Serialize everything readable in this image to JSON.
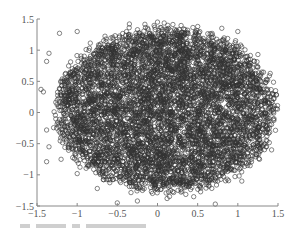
{
  "chart_data": {
    "type": "scatter",
    "title": "",
    "xlabel": "",
    "ylabel": "",
    "xlim": [
      -1.5,
      1.5
    ],
    "ylim": [
      -1.5,
      1.5
    ],
    "grid": false,
    "legend": null,
    "marker": "open-circle",
    "marker_color": "#333333",
    "x_ticks": [
      -1.5,
      -1,
      -0.5,
      0,
      0.5,
      1,
      1.5
    ],
    "x_tick_labels": [
      "-1.5",
      "-1",
      "-0.5",
      "0",
      "0.5",
      "1",
      "1.5"
    ],
    "y_ticks": [
      -1.5,
      -1,
      -0.5,
      0,
      0.5,
      1,
      1.5
    ],
    "y_tick_labels": [
      "-1.5",
      "-1",
      "-0.5",
      "0",
      "0.5",
      "1",
      "1.5"
    ],
    "distribution": {
      "count": 6000,
      "center": [
        0.1,
        0.05
      ],
      "radius_x": 1.35,
      "radius_y": 1.3,
      "shape": "uniform-disk-with-soft-edge",
      "seed": 12345
    },
    "sample_points": [
      [
        -1.22,
        1.27
      ],
      [
        -1.0,
        1.3
      ],
      [
        -1.35,
        0.95
      ],
      [
        -1.38,
        0.82
      ],
      [
        -1.45,
        0.37
      ],
      [
        -1.42,
        0.33
      ],
      [
        -1.38,
        -0.28
      ],
      [
        -1.35,
        -0.55
      ],
      [
        -1.38,
        -0.79
      ],
      [
        -1.2,
        -0.75
      ],
      [
        -1.0,
        -0.98
      ],
      [
        -0.75,
        -1.22
      ],
      [
        -0.5,
        -1.45
      ],
      [
        -0.25,
        -1.42
      ],
      [
        0.12,
        -1.38
      ],
      [
        0.45,
        -1.35
      ],
      [
        0.72,
        -1.47
      ],
      [
        1.05,
        -1.1
      ],
      [
        1.27,
        -0.75
      ],
      [
        1.42,
        -0.6
      ],
      [
        1.45,
        -0.1
      ],
      [
        1.47,
        0.35
      ],
      [
        1.35,
        0.52
      ],
      [
        1.25,
        0.93
      ],
      [
        1.0,
        1.3
      ],
      [
        0.8,
        1.35
      ],
      [
        0.5,
        1.38
      ],
      [
        0.0,
        1.45
      ],
      [
        -0.35,
        1.42
      ],
      [
        0.3,
        0.2
      ],
      [
        -0.4,
        -0.3
      ],
      [
        0.6,
        -0.5
      ],
      [
        -0.2,
        0.7
      ],
      [
        0.9,
        0.1
      ],
      [
        -0.8,
        0.2
      ]
    ]
  },
  "caption": {
    "visible_text": ""
  }
}
